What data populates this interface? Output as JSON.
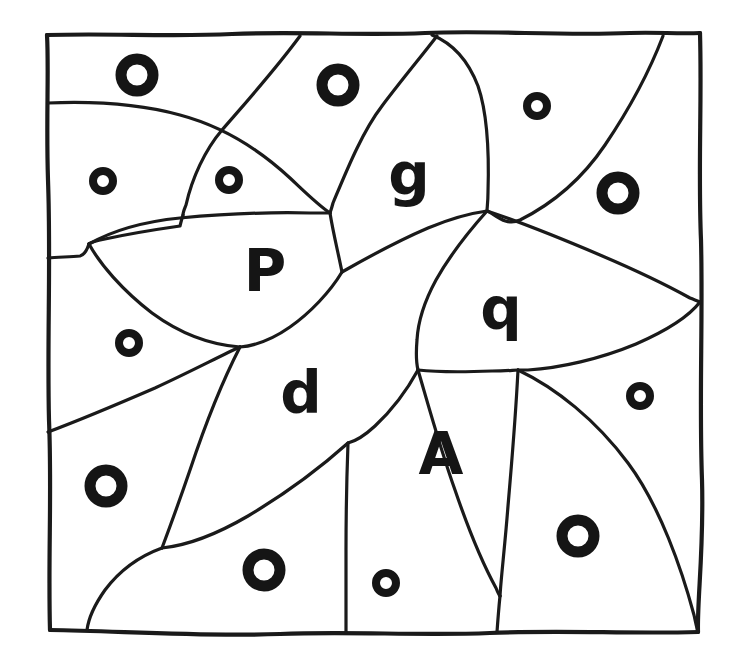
{
  "figure": {
    "kind": "line-drawing",
    "background_color": "#ffffff",
    "ink_color": "#151515",
    "canvas": {
      "width": 736,
      "height": 664
    },
    "border": {
      "label": "outer-square-frame",
      "stroke_width": 4.2,
      "corners": {
        "top_left": [
          47,
          35
        ],
        "top_right": [
          700,
          33
        ],
        "bottom_right": [
          698,
          632
        ],
        "bottom_left": [
          50,
          630
        ]
      }
    },
    "letters": [
      {
        "id": "letter-P",
        "char": "P",
        "x": 265,
        "y": 271,
        "size": 58
      },
      {
        "id": "letter-g",
        "char": "g",
        "x": 409,
        "y": 175,
        "size": 58
      },
      {
        "id": "letter-q",
        "char": "q",
        "x": 501,
        "y": 309,
        "size": 58
      },
      {
        "id": "letter-d",
        "char": "d",
        "x": 301,
        "y": 393,
        "size": 58
      },
      {
        "id": "letter-A",
        "char": "A",
        "x": 441,
        "y": 454,
        "size": 58
      }
    ],
    "rings": [
      {
        "id": "ring-1",
        "size": "large",
        "cx": 137,
        "cy": 75,
        "r": 16,
        "stroke": 11
      },
      {
        "id": "ring-2",
        "size": "large",
        "cx": 338,
        "cy": 85,
        "r": 16,
        "stroke": 11
      },
      {
        "id": "ring-3",
        "size": "small",
        "cx": 537,
        "cy": 106,
        "r": 10,
        "stroke": 8
      },
      {
        "id": "ring-4",
        "size": "small",
        "cx": 103,
        "cy": 181,
        "r": 10,
        "stroke": 8
      },
      {
        "id": "ring-5",
        "size": "small",
        "cx": 229,
        "cy": 180,
        "r": 10,
        "stroke": 8
      },
      {
        "id": "ring-6",
        "size": "large",
        "cx": 618,
        "cy": 193,
        "r": 16,
        "stroke": 11
      },
      {
        "id": "ring-7",
        "size": "small",
        "cx": 129,
        "cy": 343,
        "r": 10,
        "stroke": 8
      },
      {
        "id": "ring-8",
        "size": "small",
        "cx": 640,
        "cy": 396,
        "r": 10,
        "stroke": 8
      },
      {
        "id": "ring-9",
        "size": "large",
        "cx": 106,
        "cy": 486,
        "r": 16,
        "stroke": 11
      },
      {
        "id": "ring-10",
        "size": "large",
        "cx": 578,
        "cy": 536,
        "r": 16,
        "stroke": 11
      },
      {
        "id": "ring-11",
        "size": "large",
        "cx": 264,
        "cy": 570,
        "r": 16,
        "stroke": 11
      },
      {
        "id": "ring-12",
        "size": "small",
        "cx": 386,
        "cy": 583,
        "r": 10,
        "stroke": 8
      }
    ],
    "counts": {
      "large_rings": 6,
      "small_rings": 6,
      "letters": 5,
      "total_rings": 12
    },
    "letter_list": "P g q d A"
  }
}
